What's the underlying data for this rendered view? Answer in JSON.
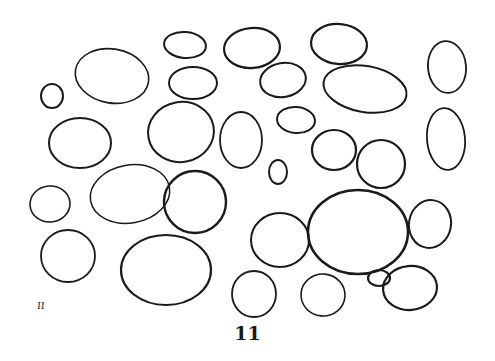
{
  "figure": {
    "caption": "11",
    "corner_mark": "ıı",
    "stroke_color": "#1a1a1a",
    "background": "#ffffff",
    "shapes": [
      {
        "cx": 112,
        "cy": 76,
        "rx": 37,
        "ry": 27,
        "rot": 10,
        "w": 1.6
      },
      {
        "cx": 185,
        "cy": 45,
        "rx": 21,
        "ry": 13,
        "rot": 5,
        "w": 2.0
      },
      {
        "cx": 193,
        "cy": 83,
        "rx": 24,
        "ry": 16,
        "rot": 0,
        "w": 2.0
      },
      {
        "cx": 252,
        "cy": 48,
        "rx": 28,
        "ry": 20,
        "rot": -5,
        "w": 2.2
      },
      {
        "cx": 283,
        "cy": 80,
        "rx": 23,
        "ry": 17,
        "rot": -10,
        "w": 2.0
      },
      {
        "cx": 339,
        "cy": 44,
        "rx": 28,
        "ry": 20,
        "rot": 5,
        "w": 2.2
      },
      {
        "cx": 365,
        "cy": 89,
        "rx": 42,
        "ry": 23,
        "rot": 10,
        "w": 2.0
      },
      {
        "cx": 447,
        "cy": 67,
        "rx": 19,
        "ry": 26,
        "rot": -5,
        "w": 1.8
      },
      {
        "cx": 52,
        "cy": 96,
        "rx": 11,
        "ry": 12,
        "rot": 0,
        "w": 2.0
      },
      {
        "cx": 80,
        "cy": 143,
        "rx": 31,
        "ry": 25,
        "rot": 0,
        "w": 2.0
      },
      {
        "cx": 181,
        "cy": 132,
        "rx": 33,
        "ry": 30,
        "rot": -10,
        "w": 2.0
      },
      {
        "cx": 241,
        "cy": 140,
        "rx": 21,
        "ry": 28,
        "rot": 0,
        "w": 1.8
      },
      {
        "cx": 296,
        "cy": 120,
        "rx": 19,
        "ry": 13,
        "rot": 5,
        "w": 2.0
      },
      {
        "cx": 334,
        "cy": 150,
        "rx": 22,
        "ry": 20,
        "rot": 0,
        "w": 2.2
      },
      {
        "cx": 446,
        "cy": 139,
        "rx": 19,
        "ry": 31,
        "rot": -5,
        "w": 1.8
      },
      {
        "cx": 278,
        "cy": 172,
        "rx": 9,
        "ry": 12,
        "rot": 0,
        "w": 2.0
      },
      {
        "cx": 381,
        "cy": 164,
        "rx": 24,
        "ry": 24,
        "rot": 0,
        "w": 2.2
      },
      {
        "cx": 50,
        "cy": 204,
        "rx": 20,
        "ry": 18,
        "rot": -5,
        "w": 1.6
      },
      {
        "cx": 130,
        "cy": 194,
        "rx": 40,
        "ry": 29,
        "rot": -10,
        "w": 1.5
      },
      {
        "cx": 195,
        "cy": 202,
        "rx": 31,
        "ry": 31,
        "rot": 0,
        "w": 2.4
      },
      {
        "cx": 68,
        "cy": 256,
        "rx": 27,
        "ry": 26,
        "rot": 0,
        "w": 1.8
      },
      {
        "cx": 166,
        "cy": 270,
        "rx": 45,
        "ry": 35,
        "rot": 0,
        "w": 2.2
      },
      {
        "cx": 280,
        "cy": 240,
        "rx": 29,
        "ry": 27,
        "rot": 0,
        "w": 2.0
      },
      {
        "cx": 358,
        "cy": 232,
        "rx": 50,
        "ry": 42,
        "rot": 0,
        "w": 2.6
      },
      {
        "cx": 430,
        "cy": 224,
        "rx": 21,
        "ry": 24,
        "rot": 10,
        "w": 2.0
      },
      {
        "cx": 379,
        "cy": 278,
        "rx": 11,
        "ry": 8,
        "rot": 0,
        "w": 2.2
      },
      {
        "cx": 410,
        "cy": 288,
        "rx": 27,
        "ry": 22,
        "rot": -5,
        "w": 2.2
      },
      {
        "cx": 254,
        "cy": 294,
        "rx": 22,
        "ry": 23,
        "rot": 0,
        "w": 1.8
      },
      {
        "cx": 323,
        "cy": 295,
        "rx": 22,
        "ry": 21,
        "rot": 5,
        "w": 1.6
      }
    ]
  }
}
